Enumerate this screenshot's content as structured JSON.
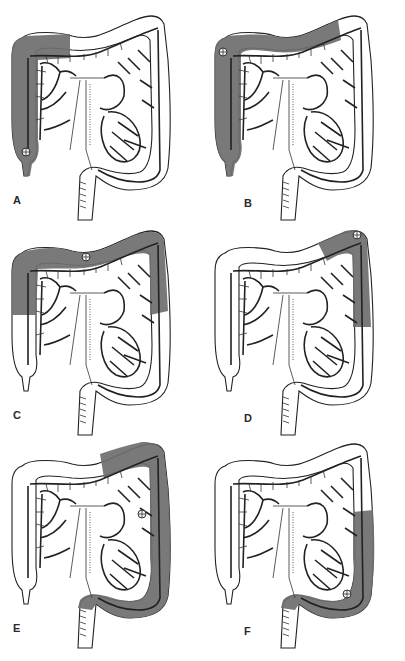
{
  "figure": {
    "shade_color": "#6e6e6e",
    "line_color": "#222222",
    "panels": [
      {
        "label": "A",
        "resected_region": "right hemicolectomy (cecum / ascending colon)",
        "tumor_location": "cecum"
      },
      {
        "label": "B",
        "resected_region": "extended right hemicolectomy",
        "tumor_location": "hepatic flexure"
      },
      {
        "label": "C",
        "resected_region": "transverse colectomy",
        "tumor_location": "mid transverse colon"
      },
      {
        "label": "D",
        "resected_region": "splenic flexure resection",
        "tumor_location": "splenic flexure"
      },
      {
        "label": "E",
        "resected_region": "left hemicolectomy",
        "tumor_location": "descending colon"
      },
      {
        "label": "F",
        "resected_region": "sigmoid colectomy",
        "tumor_location": "sigmoid colon"
      }
    ]
  }
}
